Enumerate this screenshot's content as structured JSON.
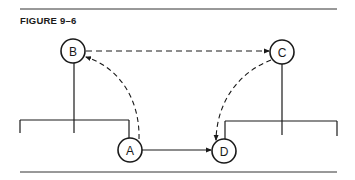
{
  "figure": {
    "title": "FIGURE 9–6"
  },
  "nodes": {
    "A": {
      "label": "A"
    },
    "B": {
      "label": "B"
    },
    "C": {
      "label": "C"
    },
    "D": {
      "label": "D"
    }
  },
  "edges": [
    {
      "from": "A",
      "to": "D",
      "style": "solid"
    },
    {
      "from": "A",
      "to": "B",
      "style": "dashed"
    },
    {
      "from": "B",
      "to": "C",
      "style": "dashed"
    },
    {
      "from": "C",
      "to": "D",
      "style": "dashed"
    }
  ],
  "colors": {
    "ink": "#1a1a1a",
    "background": "#ffffff"
  }
}
